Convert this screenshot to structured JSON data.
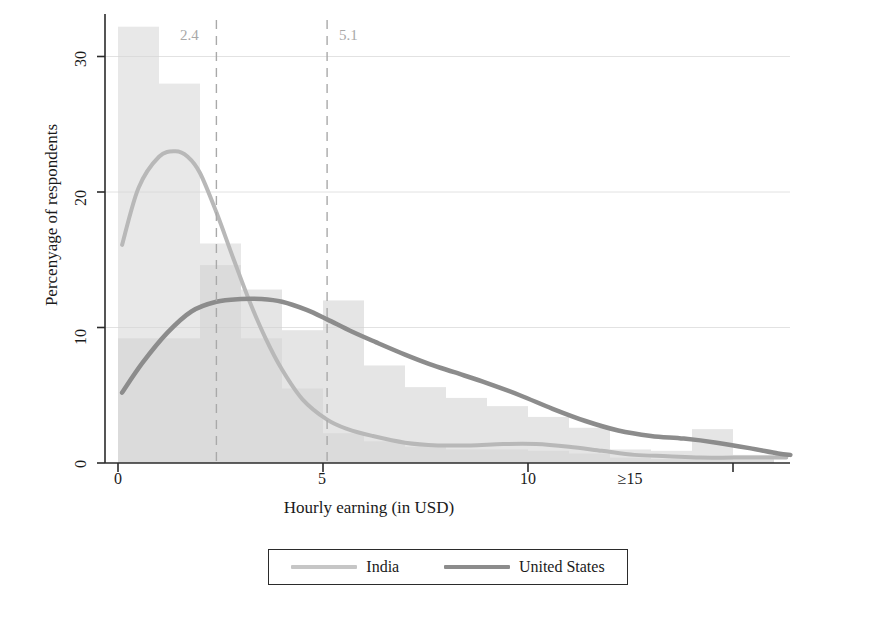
{
  "chart_data": {
    "type": "area",
    "title": "",
    "subtitle": "",
    "xlabel": "Hourly earning (in USD)",
    "ylabel": "Percenyage of respondents",
    "xlim": [
      -0.5,
      17.2
    ],
    "ylim": [
      0,
      33.5
    ],
    "xticks": [
      {
        "value": 0,
        "label": "0"
      },
      {
        "value": 5,
        "label": "5"
      },
      {
        "value": 10,
        "label": "10"
      },
      {
        "value": 15,
        "label": "≥15"
      }
    ],
    "yticks": [
      {
        "value": 0,
        "label": "0"
      },
      {
        "value": 10,
        "label": "10"
      },
      {
        "value": 20,
        "label": "20"
      },
      {
        "value": 30,
        "label": "30"
      }
    ],
    "grid": "horizontal",
    "legend_position": "bottom-center",
    "reference_lines": [
      {
        "value": 2.4,
        "label": "2.4",
        "style": "dashed",
        "color": "#a9a9a9"
      },
      {
        "value": 5.1,
        "label": "5.1",
        "style": "dashed",
        "color": "#a9a9a9"
      }
    ],
    "histograms": [
      {
        "name": "India",
        "color": "#d5d5d5",
        "bin_width": 1,
        "bins": [
          {
            "x0": 0,
            "x1": 1,
            "value": 32.2
          },
          {
            "x0": 1,
            "x1": 2,
            "value": 28.0
          },
          {
            "x0": 2,
            "x1": 3,
            "value": 16.2
          },
          {
            "x0": 3,
            "x1": 4,
            "value": 9.2
          },
          {
            "x0": 4,
            "x1": 5,
            "value": 5.5
          },
          {
            "x0": 5,
            "x1": 6,
            "value": 2.2
          },
          {
            "x0": 6,
            "x1": 7,
            "value": 1.6
          },
          {
            "x0": 7,
            "x1": 8,
            "value": 1.2
          },
          {
            "x0": 8,
            "x1": 9,
            "value": 1.0
          },
          {
            "x0": 9,
            "x1": 10,
            "value": 1.0
          },
          {
            "x0": 10,
            "x1": 11,
            "value": 0.9
          },
          {
            "x0": 11,
            "x1": 12,
            "value": 0.7
          },
          {
            "x0": 12,
            "x1": 13,
            "value": 0.4
          },
          {
            "x0": 13,
            "x1": 14,
            "value": 0.3
          },
          {
            "x0": 14,
            "x1": 15,
            "value": 0.3
          },
          {
            "x0": 15,
            "x1": 16,
            "value": 0.2
          }
        ]
      },
      {
        "name": "United States",
        "color": "#cfcfcf",
        "bin_width": 1,
        "bins": [
          {
            "x0": 0,
            "x1": 1,
            "value": 9.2
          },
          {
            "x0": 1,
            "x1": 2,
            "value": 9.2
          },
          {
            "x0": 2,
            "x1": 3,
            "value": 14.6
          },
          {
            "x0": 3,
            "x1": 4,
            "value": 12.8
          },
          {
            "x0": 4,
            "x1": 5,
            "value": 9.8
          },
          {
            "x0": 5,
            "x1": 6,
            "value": 12.0
          },
          {
            "x0": 6,
            "x1": 7,
            "value": 7.2
          },
          {
            "x0": 7,
            "x1": 8,
            "value": 5.6
          },
          {
            "x0": 8,
            "x1": 9,
            "value": 4.8
          },
          {
            "x0": 9,
            "x1": 10,
            "value": 4.2
          },
          {
            "x0": 10,
            "x1": 11,
            "value": 3.4
          },
          {
            "x0": 11,
            "x1": 12,
            "value": 2.6
          },
          {
            "x0": 12,
            "x1": 13,
            "value": 1.0
          },
          {
            "x0": 13,
            "x1": 14,
            "value": 0.9
          },
          {
            "x0": 14,
            "x1": 15,
            "value": 2.5
          },
          {
            "x0": 15,
            "x1": 16,
            "value": 0.6
          }
        ]
      }
    ],
    "series": [
      {
        "name": "India",
        "color": "#b8b8b8",
        "type": "density-curve",
        "linewidth": 4,
        "x": [
          0.1,
          0.5,
          1.0,
          1.4,
          1.7,
          2.0,
          2.4,
          2.8,
          3.2,
          3.6,
          4.0,
          4.5,
          5.1,
          5.6,
          6.2,
          7.0,
          7.8,
          8.6,
          9.4,
          10.2,
          11.0,
          11.8,
          12.6,
          13.4,
          14.2,
          15.0,
          15.8,
          16.3
        ],
        "y": [
          16.1,
          20.3,
          22.6,
          23.0,
          22.6,
          21.4,
          18.5,
          15.2,
          12.0,
          9.2,
          6.9,
          4.7,
          3.2,
          2.5,
          2.0,
          1.5,
          1.3,
          1.3,
          1.4,
          1.4,
          1.2,
          0.9,
          0.6,
          0.5,
          0.4,
          0.4,
          0.4,
          0.4
        ]
      },
      {
        "name": "United States",
        "color": "#8c8c8c",
        "type": "density-curve",
        "linewidth": 4.5,
        "x": [
          0.1,
          0.6,
          1.2,
          1.8,
          2.4,
          3.0,
          3.5,
          4.0,
          4.6,
          5.1,
          5.7,
          6.3,
          7.0,
          7.6,
          8.2,
          9.0,
          9.8,
          10.6,
          11.4,
          12.2,
          13.0,
          13.8,
          14.6,
          15.4,
          16.1,
          16.4
        ],
        "y": [
          5.2,
          7.4,
          9.6,
          11.2,
          11.9,
          12.1,
          12.1,
          11.9,
          11.3,
          10.6,
          9.7,
          8.9,
          8.0,
          7.3,
          6.7,
          5.9,
          5.0,
          4.0,
          3.1,
          2.4,
          2.0,
          1.8,
          1.5,
          1.1,
          0.7,
          0.6
        ]
      }
    ],
    "legend": [
      {
        "label": "India",
        "color": "#b8b8b8"
      },
      {
        "label": "United States",
        "color": "#8c8c8c"
      }
    ]
  }
}
